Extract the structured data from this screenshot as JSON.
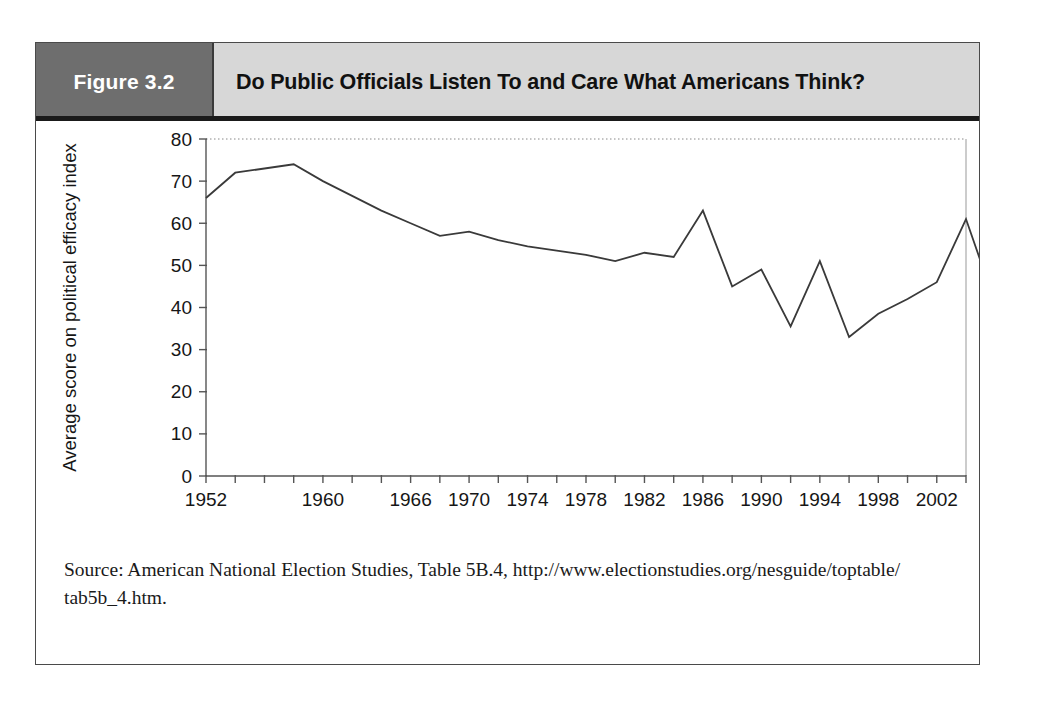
{
  "figure": {
    "number_label": "Figure 3.2",
    "title": "Do Public Officials Listen To and Care What Americans Think?",
    "source_line_1": "Source: American National Election Studies, Table 5B.4, http://www.electionstudies.org/nesguide/toptable/",
    "source_line_2": "tab5b_4.htm.",
    "header_dark_color": "#6e6e6e",
    "header_light_color": "#d7d7d7",
    "line_color": "#3a3a3a",
    "frame_color": "#4a4a4a"
  },
  "chart_data": {
    "type": "line",
    "title": "Do Public Officials Listen To and Care What Americans Think?",
    "xlabel": "",
    "ylabel": "Average score on political efficacy index",
    "ylim": [
      0,
      80
    ],
    "ytick_values": [
      0,
      10,
      20,
      30,
      40,
      50,
      60,
      70,
      80
    ],
    "ytick_labels": [
      "0",
      "10",
      "20",
      "30",
      "40",
      "50",
      "60",
      "70",
      "80"
    ],
    "xlim": [
      1952,
      2004
    ],
    "xtick_values": [
      1952,
      1954,
      1956,
      1958,
      1960,
      1962,
      1964,
      1966,
      1968,
      1970,
      1972,
      1974,
      1976,
      1978,
      1980,
      1982,
      1984,
      1986,
      1988,
      1990,
      1992,
      1994,
      1996,
      1998,
      2000,
      2002,
      2004
    ],
    "xtick_labels_shown": [
      "1952",
      "1960",
      "1966",
      "1970",
      "1974",
      "1978",
      "1982",
      "1986",
      "1990",
      "1994",
      "1998",
      "2002"
    ],
    "xtick_labeled_values": [
      1952,
      1960,
      1966,
      1970,
      1974,
      1978,
      1982,
      1986,
      1990,
      1994,
      1998,
      2002
    ],
    "grid": false,
    "top_border_dotted": true,
    "legend": null,
    "x": [
      1952,
      1954,
      1956,
      1958,
      1960,
      1962,
      1964,
      1966,
      1968,
      1970,
      1972,
      1974,
      1976,
      1978,
      1980,
      1982,
      1984,
      1986,
      1988,
      1990,
      1992,
      1994,
      1996,
      1998,
      2000,
      2002,
      2004
    ],
    "values": [
      66,
      72,
      73,
      74,
      70,
      66.5,
      63,
      60,
      57,
      58,
      56,
      54.5,
      53.5,
      52.5,
      51,
      53,
      52,
      63,
      45,
      49,
      35.5,
      51,
      33,
      38.5,
      42,
      46,
      61
    ],
    "series": [
      {
        "name": "Average score on political efficacy index",
        "values": [
          66,
          72,
          73,
          74,
          70,
          66.5,
          63,
          60,
          57,
          58,
          56,
          54.5,
          53.5,
          52.5,
          51,
          53,
          52,
          63,
          45,
          49,
          35.5,
          51,
          33,
          38.5,
          42,
          46,
          61
        ]
      }
    ],
    "points": [
      {
        "year": 1952,
        "value": 66
      },
      {
        "year": 1954,
        "value": 72
      },
      {
        "year": 1956,
        "value": 73
      },
      {
        "year": 1958,
        "value": 74
      },
      {
        "year": 1960,
        "value": 70
      },
      {
        "year": 1962,
        "value": 66.5
      },
      {
        "year": 1964,
        "value": 63
      },
      {
        "year": 1966,
        "value": 60
      },
      {
        "year": 1968,
        "value": 57
      },
      {
        "year": 1970,
        "value": 58
      },
      {
        "year": 1972,
        "value": 56
      },
      {
        "year": 1974,
        "value": 54.5
      },
      {
        "year": 1976,
        "value": 53.5
      },
      {
        "year": 1978,
        "value": 52.5
      },
      {
        "year": 1980,
        "value": 51
      },
      {
        "year": 1982,
        "value": 53
      },
      {
        "year": 1984,
        "value": 52
      },
      {
        "year": 1986,
        "value": 63
      },
      {
        "year": 1988,
        "value": 45
      },
      {
        "year": 1990,
        "value": 49
      },
      {
        "year": 1992,
        "value": 35.5
      },
      {
        "year": 1994,
        "value": 51
      },
      {
        "year": 1996,
        "value": 33
      },
      {
        "year": 1998,
        "value": 38.5
      },
      {
        "year": 2000,
        "value": 42
      },
      {
        "year": 2002,
        "value": 46
      },
      {
        "year": 2004,
        "value": 61
      }
    ],
    "tail_value": 47
  }
}
